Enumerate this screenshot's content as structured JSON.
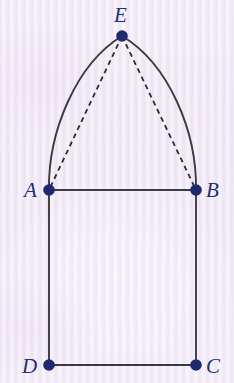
{
  "figure": {
    "canvas": {
      "width": 234,
      "height": 383
    },
    "background_color": "#f6f0f8",
    "stroke_color": "#3a3a42",
    "vertex_color": "#1f2a6e",
    "label_color": "#242f72",
    "vertices": [
      {
        "id": "A",
        "label": "A",
        "x": 49,
        "y": 190,
        "label_x": 31,
        "label_y": 197
      },
      {
        "id": "B",
        "label": "B",
        "x": 196,
        "y": 190,
        "label_x": 207,
        "label_y": 197
      },
      {
        "id": "C",
        "label": "C",
        "x": 196,
        "y": 365,
        "label_x": 207,
        "label_y": 373
      },
      {
        "id": "D",
        "label": "D",
        "x": 49,
        "y": 365,
        "label_x": 26,
        "label_y": 373
      },
      {
        "id": "E",
        "label": "E",
        "x": 122,
        "y": 36,
        "label_x": 114,
        "label_y": 22
      }
    ],
    "solid_segments": [
      {
        "name": "segment-AB",
        "from": "A",
        "to": "B",
        "x1": 49,
        "y1": 190,
        "x2": 196,
        "y2": 190
      },
      {
        "name": "segment-AD",
        "from": "A",
        "to": "D",
        "x1": 49,
        "y1": 190,
        "x2": 49,
        "y2": 365
      },
      {
        "name": "segment-BC",
        "from": "B",
        "to": "C",
        "x1": 196,
        "y1": 190,
        "x2": 196,
        "y2": 365
      },
      {
        "name": "segment-DC",
        "from": "D",
        "to": "C",
        "x1": 49,
        "y1": 365,
        "x2": 196,
        "y2": 365
      }
    ],
    "arcs": [
      {
        "name": "arc-AE",
        "from": "A",
        "to": "E",
        "path": "M 49 190 C 48 130 78 62 122 36",
        "description": "circular arc from A up to apex E, bulging left"
      },
      {
        "name": "arc-BE",
        "from": "B",
        "to": "E",
        "path": "M 196 190 C 197 130 167 62 122 36",
        "description": "circular arc from B up to apex E, bulging right"
      }
    ],
    "dashed_segments": [
      {
        "name": "chord-EA",
        "from": "E",
        "to": "A",
        "x1": 122,
        "y1": 36,
        "x2": 49,
        "y2": 190
      },
      {
        "name": "chord-EB",
        "from": "E",
        "to": "B",
        "x1": 122,
        "y1": 36,
        "x2": 196,
        "y2": 190
      }
    ],
    "dash_pattern": "5,4",
    "vertex_radius": 5.5,
    "stroke_width": 1.9
  }
}
